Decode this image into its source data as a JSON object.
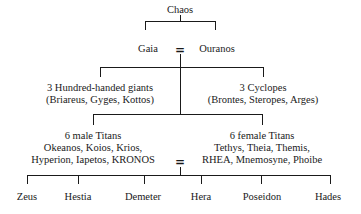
{
  "diagram": {
    "type": "genealogy-tree",
    "root": "Chaos",
    "generation1": {
      "left": "Gaia",
      "right": "Ouranos",
      "union_symbol": "="
    },
    "generation2": {
      "hundred_handed": {
        "title": "3 Hundred-handed giants",
        "members": "(Briareus, Gyges, Kottos)"
      },
      "cyclopes": {
        "title": "3 Cyclopes",
        "members": "(Brontes, Steropes, Arges)"
      },
      "male_titans": {
        "title": "6 male Titans",
        "line1": "Okeanos, Koios, Krios,",
        "line2": "Hyperion, Iapetos, KRONOS"
      },
      "female_titans": {
        "title": "6 female Titans",
        "line1": "Tethys, Theia, Themis,",
        "line2": "RHEA, Mnemosyne, Phoibe"
      },
      "union_symbol": "="
    },
    "generation3": {
      "children": [
        "Zeus",
        "Hestia",
        "Demeter",
        "Hera",
        "Poseidon",
        "Hades"
      ]
    }
  }
}
